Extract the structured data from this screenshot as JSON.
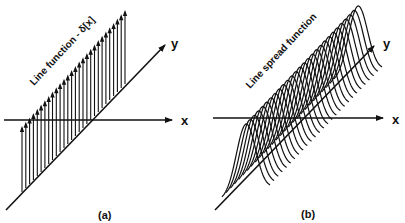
{
  "figure": {
    "panel_a": {
      "caption": "(a)",
      "title": "Line function - δ[x]",
      "x_axis_label": "x",
      "y_axis_label": "y",
      "num_impulses": 28
    },
    "panel_b": {
      "caption": "(b)",
      "title": "Line spread function",
      "x_axis_label": "x",
      "y_axis_label": "y",
      "num_profiles": 28
    },
    "colors": {
      "ink": "#111111",
      "background": "#ffffff"
    }
  }
}
